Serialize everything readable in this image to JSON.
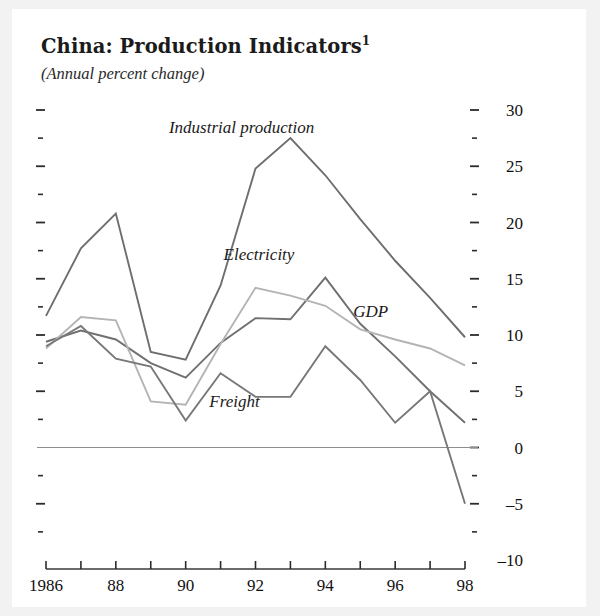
{
  "figure": {
    "title": "China:  Production Indicators",
    "title_superscript": "1",
    "subtitle": "(Annual percent change)"
  },
  "chart_data": {
    "type": "line",
    "title": "China:  Production Indicators",
    "subtitle": "(Annual percent change)",
    "xlabel": "",
    "ylabel": "",
    "xlim": [
      1986,
      1998
    ],
    "ylim": [
      -10,
      30
    ],
    "grid": false,
    "legend_position": "inline-annotations",
    "x": [
      1986,
      1987,
      1988,
      1989,
      1990,
      1991,
      1992,
      1993,
      1994,
      1995,
      1996,
      1997,
      1998
    ],
    "y_major_ticks": [
      -10,
      -5,
      0,
      5,
      10,
      15,
      20,
      25,
      30
    ],
    "y_minor_ticks": [
      -7.5,
      -2.5,
      2.5,
      7.5,
      12.5,
      17.5,
      22.5,
      27.5
    ],
    "y_tick_labels": [
      "-10",
      "-5",
      "0",
      "5",
      "10",
      "15",
      "20",
      "25",
      "30"
    ],
    "x_tick_labels": [
      "1986",
      "88",
      "90",
      "92",
      "94",
      "96",
      "98"
    ],
    "x_labeled_years": [
      1986,
      1988,
      1990,
      1992,
      1994,
      1996,
      1998
    ],
    "series": [
      {
        "name": "Industrial production",
        "color": "#6e6e6e",
        "label_x": 1991.6,
        "label_y": 28.0,
        "values": [
          11.7,
          17.7,
          20.8,
          8.5,
          7.8,
          14.4,
          24.8,
          27.5,
          24.2,
          20.3,
          16.6,
          13.3,
          9.8
        ]
      },
      {
        "name": "Electricity",
        "color": "#707070",
        "label_x": 1992.1,
        "label_y": 16.7,
        "values": [
          9.4,
          10.4,
          9.6,
          7.5,
          6.2,
          9.3,
          11.5,
          11.4,
          15.1,
          11.0,
          8.1,
          5.0,
          2.2
        ]
      },
      {
        "name": "GDP",
        "color": "#b4b4b4",
        "label_x": 1995.3,
        "label_y": 11.6,
        "values": [
          8.8,
          11.6,
          11.3,
          4.1,
          3.8,
          9.2,
          14.2,
          13.5,
          12.6,
          10.5,
          9.6,
          8.8,
          7.3
        ]
      },
      {
        "name": "Freight",
        "color": "#787878",
        "label_x": 1991.4,
        "label_y": 3.6,
        "values": [
          9.0,
          10.8,
          7.9,
          7.2,
          2.4,
          6.6,
          4.5,
          4.5,
          9.0,
          6.0,
          2.2,
          5.0,
          -5.0
        ]
      }
    ]
  }
}
